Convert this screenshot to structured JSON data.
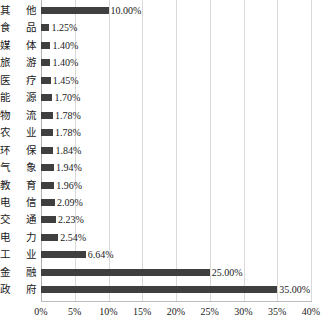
{
  "chart_data": {
    "type": "bar",
    "orientation": "horizontal",
    "title": "",
    "subtitle": "",
    "xlabel": "",
    "ylabel": "",
    "xlim": [
      0,
      40
    ],
    "xticks": [
      "0%",
      "5%",
      "10%",
      "15%",
      "20%",
      "25%",
      "30%",
      "35%",
      "40%"
    ],
    "xtick_values": [
      0,
      5,
      10,
      15,
      20,
      25,
      30,
      35,
      40
    ],
    "grid": "vertical",
    "legend": "none",
    "bar_color": "#3f3f3f",
    "gridline_color": "#d9d9d9",
    "background_color": "#ffffff",
    "categories": [
      "其他",
      "食品",
      "媒体",
      "旅游",
      "医疗",
      "能源",
      "物流",
      "农业",
      "环保",
      "气象",
      "教育",
      "电信",
      "交通",
      "电力",
      "工业",
      "金融",
      "政府"
    ],
    "values": [
      10.0,
      1.25,
      1.4,
      1.4,
      1.45,
      1.7,
      1.78,
      1.78,
      1.84,
      1.94,
      1.96,
      2.09,
      2.23,
      2.54,
      6.64,
      25.0,
      35.0
    ],
    "data_labels": [
      "10.00%",
      "1.25%",
      "1.40%",
      "1.40%",
      "1.45%",
      "1.70%",
      "1.78%",
      "1.78%",
      "1.84%",
      "1.94%",
      "1.96%",
      "2.09%",
      "2.23%",
      "2.54%",
      "6.64%",
      "25.00%",
      "35.00%"
    ],
    "points": [
      {
        "category": "其他",
        "value": 10.0,
        "label": "10.00%"
      },
      {
        "category": "食品",
        "value": 1.25,
        "label": "1.25%"
      },
      {
        "category": "媒体",
        "value": 1.4,
        "label": "1.40%"
      },
      {
        "category": "旅游",
        "value": 1.4,
        "label": "1.40%"
      },
      {
        "category": "医疗",
        "value": 1.45,
        "label": "1.45%"
      },
      {
        "category": "能源",
        "value": 1.7,
        "label": "1.70%"
      },
      {
        "category": "物流",
        "value": 1.78,
        "label": "1.78%"
      },
      {
        "category": "农业",
        "value": 1.78,
        "label": "1.78%"
      },
      {
        "category": "环保",
        "value": 1.84,
        "label": "1.84%"
      },
      {
        "category": "气象",
        "value": 1.94,
        "label": "1.94%"
      },
      {
        "category": "教育",
        "value": 1.96,
        "label": "1.96%"
      },
      {
        "category": "电信",
        "value": 2.09,
        "label": "2.09%"
      },
      {
        "category": "交通",
        "value": 2.23,
        "label": "2.23%"
      },
      {
        "category": "电力",
        "value": 2.54,
        "label": "2.54%"
      },
      {
        "category": "工业",
        "value": 6.64,
        "label": "6.64%"
      },
      {
        "category": "金融",
        "value": 25.0,
        "label": "25.00%"
      },
      {
        "category": "政府",
        "value": 35.0,
        "label": "35.00%"
      }
    ]
  }
}
